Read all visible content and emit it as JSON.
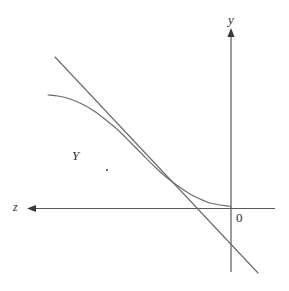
{
  "figure": {
    "width": 289,
    "height": 291,
    "background": "#ffffff",
    "stroke_color": "#6b6b6b",
    "axis_color": "#5a5a5a",
    "label_color": "#303030"
  },
  "labels": {
    "y_axis": "y",
    "z_axis": "z",
    "origin": "0",
    "curve": "Y"
  },
  "chart_data": {
    "type": "line",
    "title": "",
    "xlabel": "z",
    "ylabel": "y",
    "grid": false,
    "legend": null,
    "annotations": [
      {
        "text": "y",
        "role": "vertical-axis-name",
        "x": 232,
        "y": 22
      },
      {
        "text": "z",
        "role": "horizontal-axis-name",
        "x": 17,
        "y": 208
      },
      {
        "text": "0",
        "role": "origin-marker",
        "x": 240,
        "y": 218
      },
      {
        "text": "Y",
        "role": "curve-name",
        "x": 78,
        "y": 156
      }
    ],
    "axes": {
      "origin_px": [
        231,
        208
      ],
      "vertical_axis": {
        "from_px": [
          231,
          32
        ],
        "to_px": [
          231,
          272
        ],
        "arrow": "up"
      },
      "horizontal_axis": {
        "from_px": [
          275,
          208
        ],
        "to_px": [
          30,
          208
        ],
        "arrow": "left"
      },
      "x_direction": "increasing to the left",
      "y_direction": "increasing upward"
    },
    "series": [
      {
        "name": "Y",
        "role": "decreasing-convex-concave-curve",
        "type": "curve",
        "description": "Smooth S-shaped decreasing curve, flat on the upper-left, steepest near the middle, asymptotically approaching the horizontal axis from above on the right",
        "points_px": [
          [
            48,
            95
          ],
          [
            58,
            96
          ],
          [
            70,
            99
          ],
          [
            82,
            104
          ],
          [
            94,
            111
          ],
          [
            106,
            120
          ],
          [
            118,
            130
          ],
          [
            130,
            142
          ],
          [
            142,
            154
          ],
          [
            154,
            166
          ],
          [
            166,
            177
          ],
          [
            178,
            186
          ],
          [
            190,
            194
          ],
          [
            200,
            199
          ],
          [
            210,
            203
          ],
          [
            220,
            205
          ],
          [
            228,
            206
          ],
          [
            231,
            207
          ]
        ]
      },
      {
        "name": "tangent",
        "role": "tangent-line-at-inflection",
        "type": "line",
        "description": "Straight line tangent to the curve at its inflection point, crossing the horizontal axis to the right of the tangency",
        "from_px": [
          55,
          57
        ],
        "to_px": [
          258,
          273
        ],
        "x_intercept_px": [
          199,
          208
        ]
      }
    ],
    "tangency_point_px": [
      123,
      129
    ],
    "second_intersection_px": [
      190,
      194
    ]
  }
}
